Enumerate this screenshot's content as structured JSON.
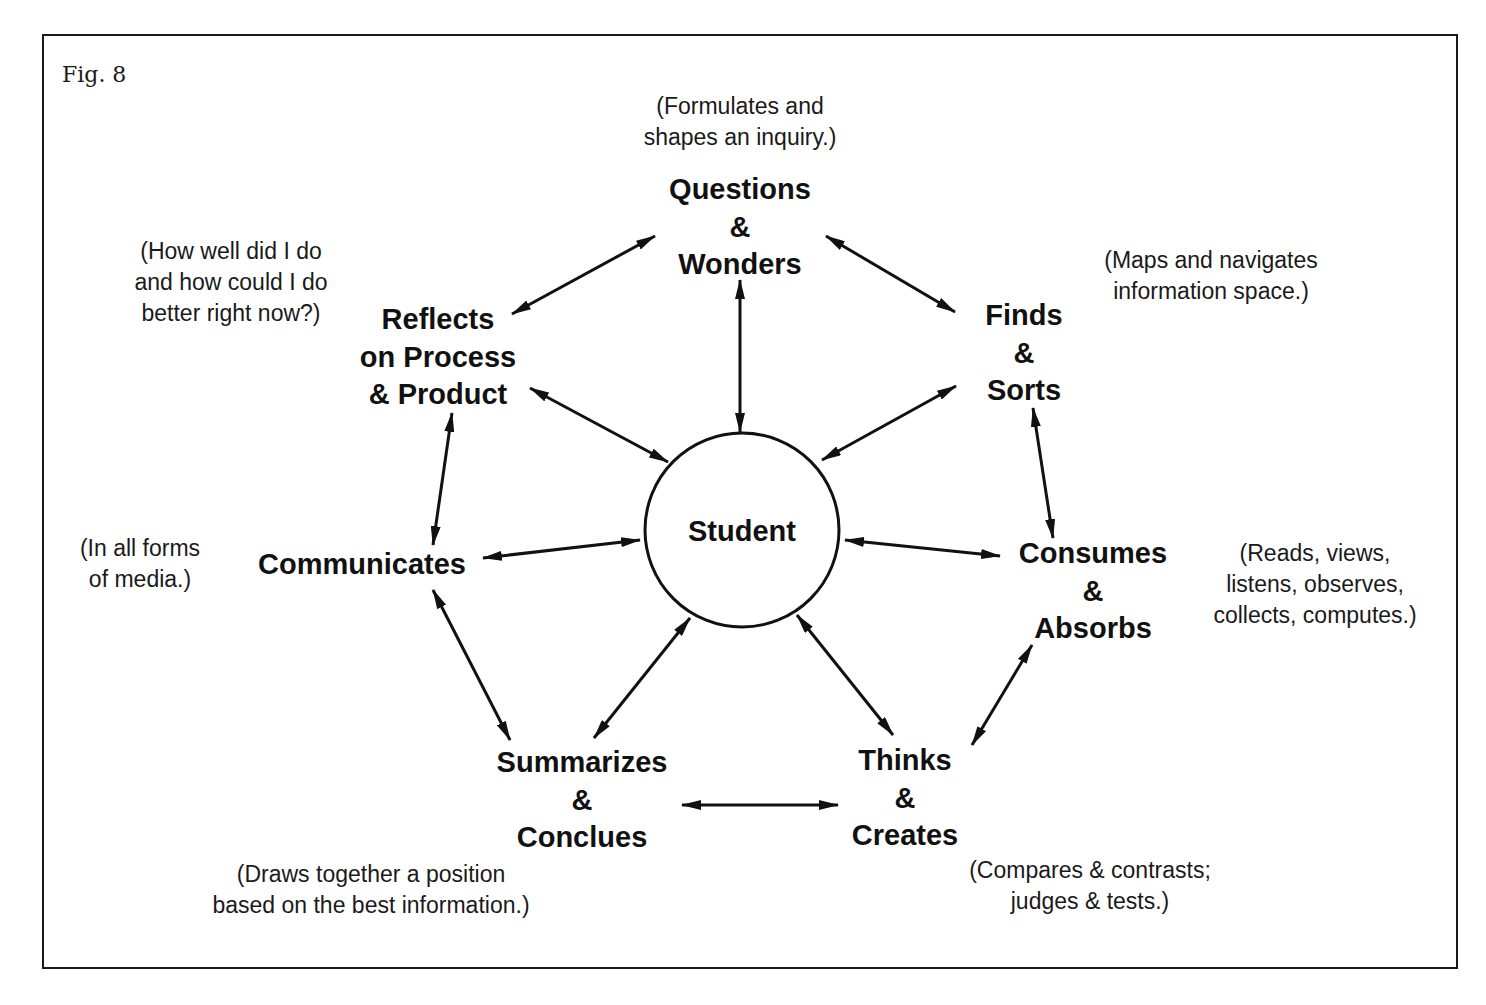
{
  "figure": {
    "label": "Fig. 8",
    "center": {
      "label": "Student",
      "cx": 742,
      "cy": 530,
      "r": 97
    },
    "nodes": [
      {
        "id": "questions",
        "lines": [
          "Questions",
          "&",
          "Wonders"
        ],
        "x": 740,
        "y": 171,
        "note": {
          "lines": [
            "(Formulates and",
            "shapes an inquiry.)"
          ],
          "x": 740,
          "y": 91
        }
      },
      {
        "id": "finds",
        "lines": [
          "Finds",
          "&",
          "Sorts"
        ],
        "x": 1024,
        "y": 297,
        "note": {
          "lines": [
            "(Maps and navigates",
            "information space.)"
          ],
          "x": 1211,
          "y": 245
        }
      },
      {
        "id": "consumes",
        "lines": [
          "Consumes",
          "&",
          "Absorbs"
        ],
        "x": 1093,
        "y": 535,
        "note": {
          "lines": [
            "(Reads, views,",
            "listens, observes,",
            "collects, computes.)"
          ],
          "x": 1315,
          "y": 538
        }
      },
      {
        "id": "thinks",
        "lines": [
          "Thinks",
          "&",
          "Creates"
        ],
        "x": 905,
        "y": 742,
        "note": {
          "lines": [
            "(Compares & contrasts;",
            "judges & tests.)"
          ],
          "x": 1090,
          "y": 855
        }
      },
      {
        "id": "summarizes",
        "lines": [
          "Summarizes",
          "&",
          "Conclues"
        ],
        "x": 582,
        "y": 744,
        "note": {
          "lines": [
            "(Draws together a position",
            "based on the best information.)"
          ],
          "x": 371,
          "y": 859
        }
      },
      {
        "id": "communicates",
        "lines": [
          "Communicates"
        ],
        "x": 362,
        "y": 546,
        "note": {
          "lines": [
            "(In all forms",
            "of media.)"
          ],
          "x": 140,
          "y": 533
        }
      },
      {
        "id": "reflects",
        "lines": [
          "Reflects",
          "on Process",
          "& Product"
        ],
        "x": 438,
        "y": 301,
        "note": {
          "lines": [
            "(How well did I do",
            "and how could I do",
            "better right now?)"
          ],
          "x": 231,
          "y": 236
        }
      }
    ],
    "arrows": [
      {
        "from": "reflects",
        "to": "questions",
        "x1": 512,
        "y1": 314,
        "x2": 655,
        "y2": 236
      },
      {
        "from": "questions",
        "to": "finds",
        "x1": 826,
        "y1": 236,
        "x2": 955,
        "y2": 312
      },
      {
        "from": "questions",
        "to": "student",
        "x1": 740,
        "y1": 280,
        "x2": 740,
        "y2": 432
      },
      {
        "from": "reflects",
        "to": "student",
        "x1": 530,
        "y1": 388,
        "x2": 668,
        "y2": 462
      },
      {
        "from": "finds",
        "to": "student",
        "x1": 956,
        "y1": 386,
        "x2": 822,
        "y2": 460
      },
      {
        "from": "reflects",
        "to": "communicates",
        "x1": 452,
        "y1": 413,
        "x2": 433,
        "y2": 545
      },
      {
        "from": "finds",
        "to": "consumes",
        "x1": 1033,
        "y1": 408,
        "x2": 1053,
        "y2": 538
      },
      {
        "from": "communicates",
        "to": "student",
        "x1": 483,
        "y1": 558,
        "x2": 640,
        "y2": 540
      },
      {
        "from": "student",
        "to": "consumes",
        "x1": 845,
        "y1": 540,
        "x2": 1000,
        "y2": 556
      },
      {
        "from": "communicates",
        "to": "summarizes",
        "x1": 433,
        "y1": 590,
        "x2": 510,
        "y2": 740
      },
      {
        "from": "summarizes",
        "to": "student",
        "x1": 594,
        "y1": 738,
        "x2": 690,
        "y2": 618
      },
      {
        "from": "student",
        "to": "thinks",
        "x1": 797,
        "y1": 615,
        "x2": 893,
        "y2": 735
      },
      {
        "from": "thinks",
        "to": "consumes",
        "x1": 972,
        "y1": 745,
        "x2": 1032,
        "y2": 645
      },
      {
        "from": "summarizes",
        "to": "thinks",
        "x1": 682,
        "y1": 805,
        "x2": 838,
        "y2": 805
      }
    ]
  }
}
